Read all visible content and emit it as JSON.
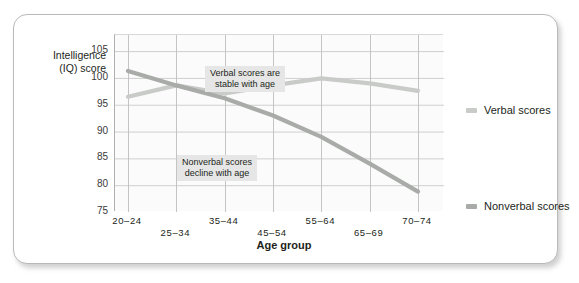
{
  "chart_data": {
    "type": "line",
    "title": "",
    "xlabel": "Age group",
    "ylabel": "Intelligence\n(IQ) score",
    "categories": [
      "20–24",
      "25–34",
      "35–44",
      "45–54",
      "55–64",
      "65–69",
      "70–74"
    ],
    "ylim": [
      75,
      108
    ],
    "yticks": [
      75,
      80,
      85,
      90,
      95,
      100,
      105
    ],
    "ytick_labels": [
      "75",
      "80",
      "85",
      "90",
      "95",
      "100",
      "105"
    ],
    "grid": true,
    "legend_position": "right",
    "series": [
      {
        "name": "Verbal scores",
        "color": "#c9cbc9",
        "values": [
          96.5,
          98.6,
          97.1,
          98.6,
          99.9,
          99.0,
          97.6
        ]
      },
      {
        "name": "Nonverbal scores",
        "color": "#a9aba9",
        "values": [
          101.3,
          98.6,
          96.2,
          93.0,
          89.0,
          84.0,
          78.8
        ]
      }
    ],
    "annotations": [
      {
        "text": "Verbal scores are\nstable with age",
        "x_left": 191,
        "y_top": 51
      },
      {
        "text": "Nonverbal scores\ndecline with age",
        "x_left": 163,
        "y_top": 140
      }
    ]
  },
  "legend": {
    "items": [
      {
        "label": "Verbal scores",
        "color": "#c9cbc9",
        "top": 89
      },
      {
        "label": "Nonverbal scores",
        "color": "#a9aba9",
        "top": 185
      }
    ]
  }
}
